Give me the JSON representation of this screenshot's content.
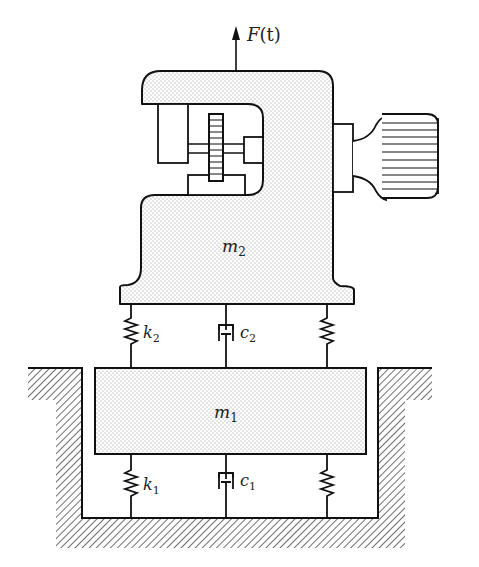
{
  "diagram": {
    "type": "two-degree-of-freedom vibration system",
    "labels": {
      "force": "F(t)",
      "force_main": "F",
      "force_arg": "(t)",
      "mass_upper": "m",
      "mass_upper_sub": "2",
      "mass_lower": "m",
      "mass_lower_sub": "1",
      "spring_upper": "k",
      "spring_upper_sub": "2",
      "damper_upper": "c",
      "damper_upper_sub": "2",
      "spring_lower": "k",
      "spring_lower_sub": "1",
      "damper_lower": "c",
      "damper_lower_sub": "1"
    },
    "components": [
      {
        "name": "machine-body",
        "label": "m2"
      },
      {
        "name": "gear",
        "label": ""
      },
      {
        "name": "motor",
        "label": ""
      },
      {
        "name": "foundation-block",
        "label": "m1"
      },
      {
        "name": "upper-spring-left",
        "label": "k2"
      },
      {
        "name": "upper-damper",
        "label": "c2"
      },
      {
        "name": "upper-spring-right",
        "label": ""
      },
      {
        "name": "lower-spring-left",
        "label": "k1"
      },
      {
        "name": "lower-damper",
        "label": "c1"
      },
      {
        "name": "lower-spring-right",
        "label": ""
      },
      {
        "name": "ground-pit",
        "label": ""
      }
    ],
    "colors": {
      "line": "#111111",
      "fill_dots": "#9a9a9a",
      "background": "#ffffff"
    }
  }
}
